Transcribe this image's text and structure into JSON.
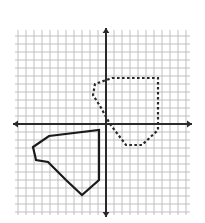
{
  "figure": {
    "title": "Translation",
    "width": 205,
    "height": 223,
    "background_color": "#ffffff",
    "title_color": "#2b2b2b"
  },
  "chart_data": {
    "type": "scatter",
    "title": "Translation",
    "subtitle": "",
    "xlabel": "",
    "ylabel": "",
    "grid": true,
    "grid_color": "#b9b9b9",
    "grid_cell_px": 8,
    "axis_color": "#2a2a2a",
    "legend": "none",
    "axes": {
      "origin_px": {
        "x": 106,
        "y": 124
      },
      "x_axis": {
        "y_px": 124,
        "x_start_px": 13,
        "x_end_px": 192,
        "arrows": "both"
      },
      "y_axis": {
        "x_px": 106,
        "y_start_px": 28,
        "y_end_px": 217,
        "arrows": "both"
      },
      "xlim": [
        -11.6,
        10.8
      ],
      "ylim": [
        -11.6,
        12.0
      ],
      "tick_labels": []
    },
    "plot_region_px": {
      "left": 15,
      "top": 30,
      "right": 190,
      "bottom": 215
    },
    "series": [
      {
        "name": "pre-image",
        "style": "dashed",
        "color": "#2a2a2a",
        "linewidth": 2.2,
        "closed": true,
        "points_px": [
          [
            112,
            78
          ],
          [
            158,
            78
          ],
          [
            158,
            130
          ],
          [
            142,
            145
          ],
          [
            126,
            145
          ],
          [
            110,
            124
          ],
          [
            100,
            106
          ],
          [
            93,
            95
          ],
          [
            95,
            84
          ]
        ],
        "points_grid": [
          [
            0.75,
            5.75
          ],
          [
            6.5,
            5.75
          ],
          [
            6.5,
            -0.75
          ],
          [
            4.5,
            -2.6
          ],
          [
            2.5,
            -2.6
          ],
          [
            0.5,
            0.0
          ],
          [
            -0.75,
            2.25
          ],
          [
            -1.6,
            3.6
          ],
          [
            -1.4,
            5.0
          ]
        ]
      },
      {
        "name": "image",
        "style": "solid",
        "color": "#1a1a1a",
        "linewidth": 2.2,
        "closed": true,
        "points_px": [
          [
            49,
            136
          ],
          [
            99,
            130
          ],
          [
            99,
            180
          ],
          [
            82,
            195
          ],
          [
            66,
            180
          ],
          [
            48,
            162
          ],
          [
            36,
            160
          ],
          [
            33,
            147
          ]
        ],
        "points_grid": [
          [
            -7.1,
            -1.5
          ],
          [
            -0.9,
            -0.75
          ],
          [
            -0.9,
            -7.0
          ],
          [
            -3.0,
            -8.9
          ],
          [
            -5.0,
            -7.0
          ],
          [
            -7.25,
            -4.75
          ],
          [
            -8.75,
            -4.5
          ],
          [
            -9.1,
            -2.9
          ]
        ]
      }
    ]
  }
}
